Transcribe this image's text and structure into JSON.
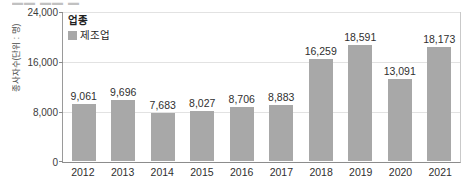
{
  "top_cutoff_text": "▬▬ ▬▬ ▬",
  "chart_data": {
    "type": "bar",
    "title": "",
    "xlabel": "",
    "ylabel": "종사자수(단위 : 명)",
    "ylim": [
      0,
      24000
    ],
    "yticks": [
      "24,000",
      "16,000",
      "8,000",
      "0"
    ],
    "grid": true,
    "legend_position": "top-left",
    "legend_title": "업종",
    "categories": [
      "2012",
      "2013",
      "2014",
      "2015",
      "2016",
      "2017",
      "2018",
      "2019",
      "2020",
      "2021"
    ],
    "series": [
      {
        "name": "제조업",
        "color": "#a8a8a8",
        "values": [
          9061,
          9696,
          7683,
          8027,
          8706,
          8883,
          16259,
          18591,
          13091,
          18173
        ],
        "labels": [
          "9,061",
          "9,696",
          "7,683",
          "8,027",
          "8,706",
          "8,883",
          "16,259",
          "18,591",
          "13,091",
          "18,173"
        ]
      }
    ]
  }
}
